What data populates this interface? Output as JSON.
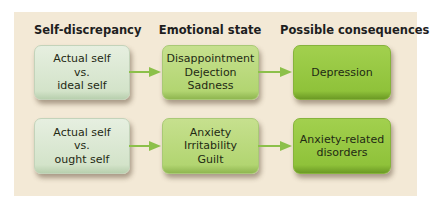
{
  "headers": {
    "col1": "Self-discrepancy",
    "col2": "Emotional state",
    "col3": "Possible consequences"
  },
  "rows": [
    {
      "discrepancy": [
        "Actual self",
        "vs.",
        "ideal self"
      ],
      "emotions": [
        "Disappointment",
        "Dejection",
        "Sadness"
      ],
      "consequence": [
        "Depression"
      ]
    },
    {
      "discrepancy": [
        "Actual self",
        "vs.",
        "ought self"
      ],
      "emotions": [
        "Anxiety",
        "Irritability",
        "Guilt"
      ],
      "consequence": [
        "Anxiety-related",
        "disorders"
      ]
    }
  ],
  "colors": {
    "panel_bg": "#f3e9d6",
    "col1_box": "#d8e6ce",
    "col2_box": "#b8d87a",
    "col3_box": "#93c43f",
    "arrow": "#8cc04a"
  }
}
